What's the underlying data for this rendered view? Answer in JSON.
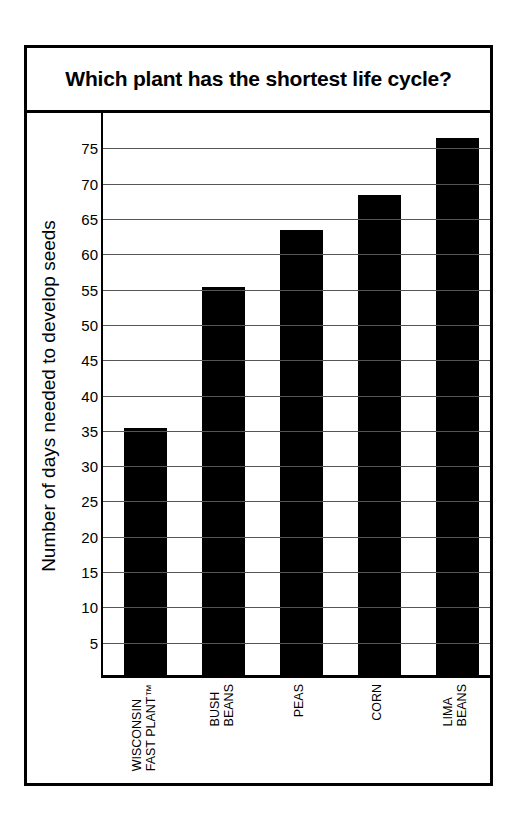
{
  "title": "Which plant has the shortest life cycle?",
  "axis": {
    "ylabel": "Number of days needed to develop seeds",
    "ticks": [
      "75",
      "70",
      "65",
      "60",
      "55",
      "50",
      "45",
      "40",
      "35",
      "30",
      "25",
      "20",
      "15",
      "10",
      "5"
    ]
  },
  "categories": [
    {
      "line1": "WISCONSIN",
      "line2": "FAST PLANT™"
    },
    {
      "line1": "BUSH",
      "line2": "BEANS"
    },
    {
      "line1": "PEAS",
      "line2": ""
    },
    {
      "line1": "CORN",
      "line2": ""
    },
    {
      "line1": "LIMA",
      "line2": "BEANS"
    }
  ],
  "colors": {
    "bar": "#000000",
    "frame": "#000000",
    "grid": "#555555",
    "background": "#ffffff"
  },
  "chart_data": {
    "type": "bar",
    "title": "Which plant has the shortest life cycle?",
    "xlabel": "",
    "ylabel": "Number of days needed to develop seeds",
    "categories": [
      "WISCONSIN FAST PLANT™",
      "BUSH BEANS",
      "PEAS",
      "CORN",
      "LIMA BEANS"
    ],
    "values": [
      35,
      55,
      63,
      68,
      76
    ],
    "ylim": [
      0,
      80
    ],
    "yticks": [
      5,
      10,
      15,
      20,
      25,
      30,
      35,
      40,
      45,
      50,
      55,
      60,
      65,
      70,
      75
    ],
    "grid": true,
    "legend": false,
    "bar_color": "#000000"
  }
}
